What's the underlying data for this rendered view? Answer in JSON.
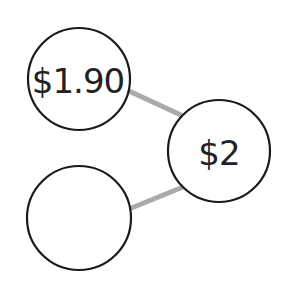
{
  "diagram": {
    "type": "number-bond",
    "colors": {
      "background": "#ffffff",
      "node_stroke": "#1a1a1a",
      "edge": "#aaaaaa",
      "text": "#222222"
    },
    "nodes": [
      {
        "id": "part-top",
        "label": "$1.90",
        "cx": 79,
        "cy": 79,
        "r": 51
      },
      {
        "id": "part-bottom",
        "label": "",
        "cx": 79,
        "cy": 218,
        "r": 52
      },
      {
        "id": "whole",
        "label": "$2",
        "cx": 219,
        "cy": 151,
        "r": 51
      }
    ],
    "edges": [
      {
        "from": "part-top",
        "to": "whole"
      },
      {
        "from": "part-bottom",
        "to": "whole"
      }
    ]
  }
}
